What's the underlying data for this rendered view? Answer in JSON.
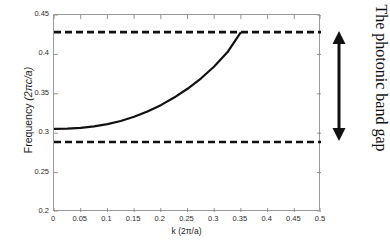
{
  "chart_data": {
    "type": "line",
    "title": "",
    "xlabel": "k (2π/a)",
    "ylabel": "Frequency  (2πc/a)",
    "ylabel_main": "Frequency",
    "ylabel_unit": "(2πc/a)",
    "xlim": [
      0,
      0.5
    ],
    "ylim": [
      0.2,
      0.45
    ],
    "grid": false,
    "legend": false,
    "xticks": [
      0,
      0.05,
      0.1,
      0.15,
      0.2,
      0.25,
      0.3,
      0.35,
      0.4,
      0.45,
      0.5
    ],
    "xtick_labels": [
      "0",
      "0.05",
      "0.1",
      "0.15",
      "0.2",
      "0.25",
      "0.3",
      "0.35",
      "0.4",
      "0.45",
      "0.5"
    ],
    "yticks": [
      0.2,
      0.25,
      0.3,
      0.35,
      0.4,
      0.45
    ],
    "ytick_labels": [
      "0.2",
      "0.25",
      "0.3",
      "0.35",
      "0.4",
      "0.45"
    ],
    "series": [
      {
        "name": "band",
        "style": "solid",
        "color": "#111111",
        "x": [
          0.0,
          0.025,
          0.05,
          0.075,
          0.1,
          0.125,
          0.15,
          0.175,
          0.2,
          0.225,
          0.25,
          0.275,
          0.3,
          0.325,
          0.35
        ],
        "values": [
          0.3054,
          0.3058,
          0.3068,
          0.3086,
          0.3115,
          0.3155,
          0.3208,
          0.3275,
          0.3356,
          0.3452,
          0.3564,
          0.3694,
          0.3846,
          0.403,
          0.4283
        ]
      },
      {
        "name": "upper band edge",
        "style": "dashed",
        "color": "#111111",
        "x": [
          0.0,
          0.5
        ],
        "values": [
          0.4283,
          0.4283
        ]
      },
      {
        "name": "lower band edge",
        "style": "dashed",
        "color": "#111111",
        "x": [
          0.0,
          0.5
        ],
        "values": [
          0.2888,
          0.2888
        ]
      }
    ],
    "annotations": [
      {
        "name": "photonic-band-gap",
        "text": "The photonic band gap",
        "arrow": "double-headed-vertical",
        "y_from": 0.2888,
        "y_to": 0.4283
      }
    ]
  }
}
